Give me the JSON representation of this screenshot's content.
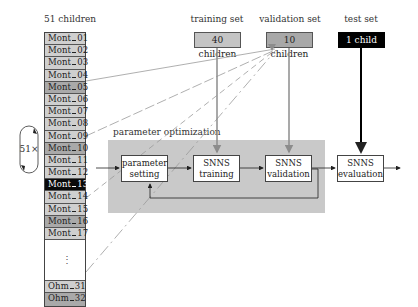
{
  "labels": {
    "children_count": "51 children",
    "training_set": "training set",
    "validation_set": "validation set",
    "test_set": "test set",
    "parameter_optimization": "parameter optimization",
    "repeat": "51×"
  },
  "sets": {
    "training": "40 children",
    "validation": "10 children",
    "test": "1 child"
  },
  "colors": {
    "training_fill": "#c4c4c4",
    "validation_fill": "#a8a8a8",
    "test_fill": "#000000",
    "optimization_fill": "#c9c9c9",
    "gray_arrow": "#8c8c8c",
    "black_arrow": "#000000"
  },
  "children_list": [
    {
      "prefix": "Mont",
      "num": "01",
      "shade": "light"
    },
    {
      "prefix": "Mont",
      "num": "02",
      "shade": "light"
    },
    {
      "prefix": "Mont",
      "num": "03",
      "shade": "light"
    },
    {
      "prefix": "Mont",
      "num": "04",
      "shade": "light"
    },
    {
      "prefix": "Mont",
      "num": "05",
      "shade": "dark"
    },
    {
      "prefix": "Mont",
      "num": "06",
      "shade": "light"
    },
    {
      "prefix": "Mont",
      "num": "07",
      "shade": "light"
    },
    {
      "prefix": "Mont",
      "num": "08",
      "shade": "light"
    },
    {
      "prefix": "Mont",
      "num": "09",
      "shade": "light"
    },
    {
      "prefix": "Mont",
      "num": "10",
      "shade": "dark"
    },
    {
      "prefix": "Mont",
      "num": "11",
      "shade": "light"
    },
    {
      "prefix": "Mont",
      "num": "12",
      "shade": "light"
    },
    {
      "prefix": "Mont",
      "num": "13",
      "shade": "selected"
    },
    {
      "prefix": "Mont",
      "num": "14",
      "shade": "light"
    },
    {
      "prefix": "Mont",
      "num": "15",
      "shade": "light"
    },
    {
      "prefix": "Mont",
      "num": "16",
      "shade": "dark"
    },
    {
      "prefix": "Mont",
      "num": "17",
      "shade": "light"
    }
  ],
  "children_list_ellipsis": "⋮",
  "children_list_tail": [
    {
      "prefix": "Ohm",
      "num": "31",
      "shade": "light"
    },
    {
      "prefix": "Ohm",
      "num": "32",
      "shade": "dark"
    }
  ],
  "process": {
    "parameter_setting": [
      "parameter",
      "setting"
    ],
    "snns_training": [
      "SNNS",
      "training"
    ],
    "snns_validation": [
      "SNNS",
      "validation"
    ],
    "snns_evaluation": [
      "SNNS",
      "evaluation"
    ]
  }
}
